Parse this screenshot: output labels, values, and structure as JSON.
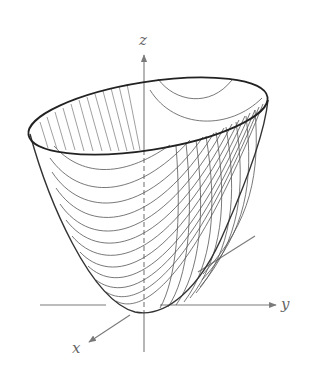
{
  "figure": {
    "surface": "paraboloid",
    "axes": {
      "x": {
        "label": "x"
      },
      "y": {
        "label": "y"
      },
      "z": {
        "label": "z"
      }
    },
    "colors": {
      "axis": "#7a7a7a",
      "rim": "#222222",
      "trace": "#555555",
      "background": "#ffffff"
    }
  }
}
